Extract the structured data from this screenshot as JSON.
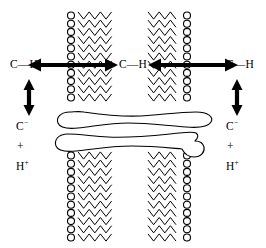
{
  "figure": {
    "background_color": "#ffffff",
    "stroke_color": "#000000",
    "width": 266,
    "height": 248
  },
  "labels": {
    "left": {
      "bond": "C—H",
      "anion": "C",
      "anion_charge": "−",
      "plus": "+",
      "proton": "H",
      "proton_charge": "+"
    },
    "center": {
      "bond": "C—H"
    },
    "right": {
      "bond": "C—H",
      "anion": "C",
      "anion_charge": "−",
      "plus": "+",
      "proton": "H",
      "proton_charge": "+"
    }
  },
  "arrows": {
    "horizontal": [
      {
        "name": "left-horizontal-double-arrow",
        "x1": 28,
        "x2": 118,
        "y": 65,
        "double_headed": true
      },
      {
        "name": "right-horizontal-double-arrow",
        "x1": 148,
        "x2": 238,
        "y": 65,
        "double_headed": true
      }
    ],
    "vertical": [
      {
        "name": "left-vertical-double-arrow",
        "x": 29,
        "y1": 79,
        "y2": 116,
        "double_headed": true
      },
      {
        "name": "right-vertical-double-arrow",
        "x": 237,
        "y1": 79,
        "y2": 116,
        "double_headed": true
      }
    ]
  },
  "membranes": [
    {
      "name": "left-membrane-column",
      "heads_side": "left",
      "head_x": 71,
      "tail_x_start": 78,
      "tail_x_end": 112,
      "segments": [
        {
          "y_top": 12,
          "y_bottom": 104
        },
        {
          "y_top": 152,
          "y_bottom": 241
        }
      ]
    },
    {
      "name": "right-membrane-column",
      "heads_side": "right",
      "head_x": 187,
      "tail_x_start": 148,
      "tail_x_end": 181,
      "segments": [
        {
          "y_top": 12,
          "y_bottom": 104
        },
        {
          "y_top": 152,
          "y_bottom": 241
        }
      ]
    }
  ],
  "protein": {
    "name": "transmembrane-peptide-blob",
    "strands": 2,
    "fill": "#ffffff",
    "stroke": "#000000",
    "upper_y": 120,
    "lower_y": 143,
    "x_start": 57,
    "x_end": 213
  },
  "chart_data": {
    "type": "diagram",
    "elements": [
      "left C—H label",
      "left vertical dissociation arrow",
      "left C⁻ + H⁺ products",
      "left horizontal transport arrow",
      "left lipid bilayer column",
      "center C—H label",
      "right lipid bilayer column",
      "right horizontal transport arrow",
      "right C—H label",
      "right vertical dissociation arrow",
      "right C⁻ + H⁺ products",
      "transmembrane peptide blob spanning both bilayers"
    ]
  }
}
